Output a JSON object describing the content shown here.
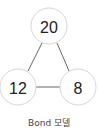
{
  "diagram": {
    "nodes": [
      {
        "id": "top",
        "label": "20",
        "cx": 49,
        "cy": 26,
        "r": 18
      },
      {
        "id": "bottom-left",
        "label": "12",
        "cx": 18,
        "cy": 87,
        "r": 18
      },
      {
        "id": "bottom-right",
        "label": "8",
        "cx": 78,
        "cy": 87,
        "r": 18
      }
    ],
    "edges": [
      {
        "from": "top",
        "to": "bottom-left"
      },
      {
        "from": "top",
        "to": "bottom-right"
      },
      {
        "from": "bottom-left",
        "to": "bottom-right"
      }
    ],
    "caption": "Bond 모델"
  }
}
